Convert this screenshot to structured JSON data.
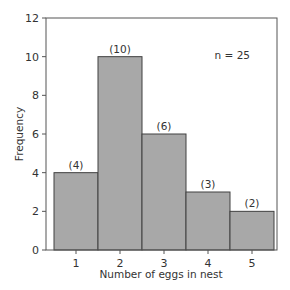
{
  "chart_data": {
    "type": "bar",
    "title": "",
    "xlabel": "Number of eggs in nest",
    "ylabel": "Frequency",
    "categories": [
      "1",
      "2",
      "3",
      "4",
      "5"
    ],
    "values": [
      4,
      10,
      6,
      3,
      2
    ],
    "bar_labels": [
      "(4)",
      "(10)",
      "(6)",
      "(3)",
      "(2)"
    ],
    "ylim": [
      0,
      12
    ],
    "yticks": [
      0,
      2,
      4,
      6,
      8,
      10,
      12
    ],
    "grid": false,
    "legend": null,
    "annotations": [
      "n = 25"
    ],
    "bar_color": "#a8a8a8",
    "bar_edge_color": "#404040",
    "histogram": true
  }
}
